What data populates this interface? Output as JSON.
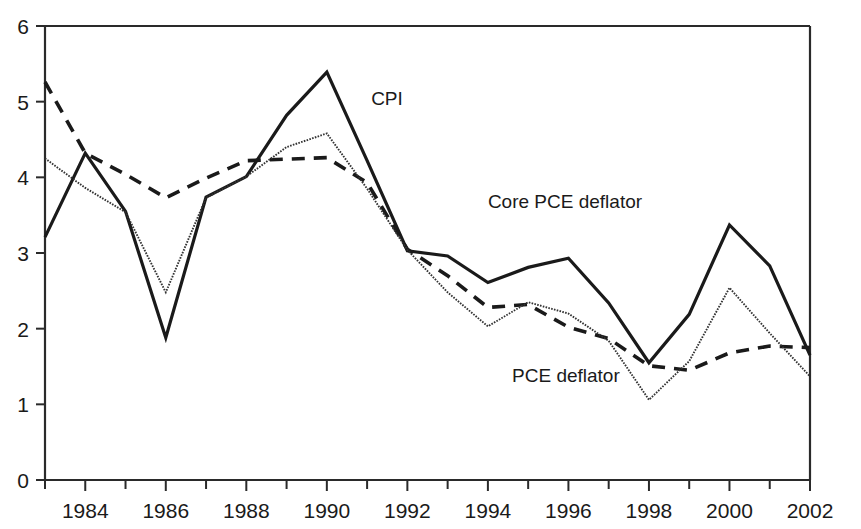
{
  "chart_data": {
    "type": "line",
    "title": "",
    "subtitle": "",
    "xlabel": "",
    "ylabel": "",
    "xlim": [
      1983,
      2002
    ],
    "ylim": [
      0,
      6
    ],
    "yticks": [
      0,
      1,
      2,
      3,
      4,
      5,
      6
    ],
    "ytick_labels": [
      "0",
      "1",
      "2",
      "3",
      "4",
      "5",
      "6"
    ],
    "xticks": [
      1983,
      1984,
      1985,
      1986,
      1987,
      1988,
      1989,
      1990,
      1991,
      1992,
      1993,
      1994,
      1995,
      1996,
      1997,
      1998,
      1999,
      2000,
      2001,
      2002
    ],
    "xtick_labels": [
      "",
      "1984",
      "",
      "1986",
      "",
      "1988",
      "",
      "1990",
      "",
      "1992",
      "",
      "1994",
      "",
      "1996",
      "",
      "1998",
      "",
      "2000",
      "",
      "2002"
    ],
    "grid": false,
    "legend_position": "inline-annotations",
    "x": [
      1983,
      1984,
      1985,
      1986,
      1987,
      1988,
      1989,
      1990,
      1991,
      1992,
      1993,
      1994,
      1995,
      1996,
      1997,
      1998,
      1999,
      2000,
      2001,
      2002
    ],
    "series": [
      {
        "name": "CPI",
        "style": "solid",
        "label": "CPI",
        "label_x": 1991.1,
        "label_y": 4.95,
        "values": [
          3.21,
          4.32,
          3.55,
          1.88,
          3.74,
          4.01,
          4.82,
          5.39,
          4.22,
          3.03,
          2.96,
          2.61,
          2.81,
          2.93,
          2.34,
          1.55,
          2.19,
          3.37,
          2.83,
          1.65
        ]
      },
      {
        "name": "Core PCE deflator",
        "style": "dashed",
        "label": "Core PCE deflator",
        "label_x": 1994.0,
        "label_y": 3.6,
        "values": [
          5.26,
          4.32,
          4.04,
          3.73,
          3.99,
          4.22,
          4.24,
          4.26,
          3.93,
          3.05,
          2.7,
          2.28,
          2.32,
          2.02,
          1.87,
          1.51,
          1.45,
          1.68,
          1.77,
          1.75
        ]
      },
      {
        "name": "PCE deflator",
        "style": "dotted",
        "label": "PCE deflator",
        "label_x": 1994.6,
        "label_y": 1.3,
        "values": [
          4.25,
          3.86,
          3.54,
          2.48,
          3.73,
          4.01,
          4.4,
          4.58,
          3.85,
          3.04,
          2.48,
          2.03,
          2.35,
          2.2,
          1.84,
          1.06,
          1.57,
          2.54,
          1.94,
          1.37
        ]
      }
    ]
  }
}
